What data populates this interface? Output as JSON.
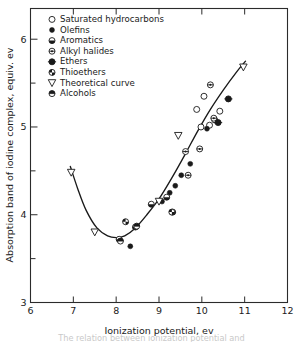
{
  "figure": {
    "caption_partial": "The relation between ionization potential and",
    "background": "#ffffff",
    "ink_color": "#1a1a1a"
  },
  "chart_data": {
    "type": "scatter",
    "title": "",
    "xlabel": "Ionization potential, ev",
    "ylabel": "Absorption band of iodine complex, equiv. ev",
    "xlim": [
      6,
      12
    ],
    "ylim": [
      3,
      6.35
    ],
    "xticks": [
      6,
      7,
      8,
      9,
      10,
      11,
      12
    ],
    "yticks": [
      3,
      4,
      5,
      6
    ],
    "yminorticks": [
      3.5,
      4.5,
      5.5
    ],
    "grid": false,
    "legend_position": "upper-left",
    "series": [
      {
        "name": "Saturated hydrocarbons",
        "marker": "open-circle",
        "points": [
          [
            9.88,
            5.2
          ],
          [
            10.05,
            5.35
          ],
          [
            10.18,
            5.02
          ],
          [
            10.3,
            5.08
          ],
          [
            10.42,
            5.18
          ],
          [
            9.98,
            5.0
          ]
        ]
      },
      {
        "name": "Olefins",
        "marker": "filled-circle",
        "points": [
          [
            8.33,
            3.64
          ],
          [
            9.25,
            4.25
          ],
          [
            9.38,
            4.33
          ],
          [
            9.52,
            4.45
          ],
          [
            9.73,
            4.58
          ],
          [
            10.12,
            4.98
          ],
          [
            9.07,
            4.15
          ]
        ]
      },
      {
        "name": "Aromatics",
        "marker": "half-filled-circle",
        "points": [
          [
            8.07,
            3.72
          ],
          [
            8.45,
            3.86
          ],
          [
            9.18,
            4.2
          ],
          [
            9.32,
            4.03
          ],
          [
            8.82,
            4.12
          ]
        ]
      },
      {
        "name": "Alkyl halides",
        "marker": "cross-circle",
        "points": [
          [
            9.62,
            4.72
          ],
          [
            9.95,
            4.75
          ],
          [
            10.2,
            5.48
          ],
          [
            10.28,
            5.1
          ],
          [
            9.68,
            4.45
          ]
        ]
      },
      {
        "name": "Ethers",
        "marker": "filled-circle-ring",
        "points": [
          [
            10.62,
            5.32
          ],
          [
            10.38,
            5.05
          ]
        ]
      },
      {
        "name": "Thioethers",
        "marker": "quarter-filled-circle",
        "points": [
          [
            8.22,
            3.92
          ],
          [
            9.3,
            4.03
          ]
        ]
      },
      {
        "name": "Theoretical curve",
        "marker": "open-triangle-down",
        "points": [
          [
            6.95,
            4.48
          ],
          [
            7.5,
            3.8
          ],
          [
            9.0,
            4.15
          ],
          [
            9.45,
            4.9
          ],
          [
            10.97,
            5.68
          ]
        ]
      },
      {
        "name": "Alcohols",
        "marker": "half-filled-circle-alt",
        "points": [
          [
            8.1,
            3.7
          ],
          [
            8.48,
            3.87
          ]
        ]
      }
    ],
    "theoretical_curve": {
      "name": "Theoretical curve",
      "x": [
        6.93,
        7.1,
        7.3,
        7.55,
        7.8,
        8.0,
        8.2,
        8.45,
        8.7,
        9.0,
        9.3,
        9.6,
        9.9,
        10.2,
        10.5,
        10.8,
        11.02
      ],
      "y": [
        4.55,
        4.3,
        4.05,
        3.85,
        3.76,
        3.74,
        3.76,
        3.85,
        3.99,
        4.18,
        4.42,
        4.68,
        4.95,
        5.2,
        5.42,
        5.62,
        5.75
      ]
    }
  },
  "legend": {
    "items": [
      {
        "label": "Saturated hydrocarbons",
        "marker": "open-circle"
      },
      {
        "label": "Olefins",
        "marker": "filled-circle"
      },
      {
        "label": "Aromatics",
        "marker": "half-filled-circle"
      },
      {
        "label": "Alkyl halides",
        "marker": "cross-circle"
      },
      {
        "label": "Ethers",
        "marker": "filled-circle-ring"
      },
      {
        "label": "Thioethers",
        "marker": "quarter-filled-circle"
      },
      {
        "label": "Theoretical curve",
        "marker": "open-triangle-down"
      },
      {
        "label": "Alcohols",
        "marker": "half-filled-circle-alt"
      }
    ]
  },
  "axes": {
    "x_tick_labels": [
      "6",
      "7",
      "8",
      "9",
      "10",
      "11",
      "12"
    ],
    "y_tick_labels": [
      "3",
      "4",
      "5",
      "6"
    ],
    "x_title": "Ionization potential, ev",
    "y_title": "Absorption band of iodine complex, equiv. ev"
  }
}
